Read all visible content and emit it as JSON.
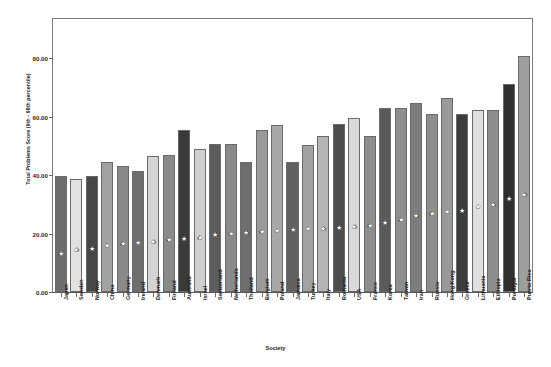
{
  "chart_data": {
    "type": "bar",
    "title": "",
    "xlabel": "Society",
    "ylabel": "Total Problems Score (9th - 98th percentile)",
    "ylim": [
      0,
      80
    ],
    "yticks": [
      "0.00",
      "20.00",
      "40.00",
      "60.00",
      "80.00"
    ],
    "ytick_values": [
      0,
      20,
      40,
      60,
      80
    ],
    "grid": false,
    "legend": "none",
    "categories": [
      "Japan",
      "Sweden",
      "Norway",
      "China",
      "Germany",
      "Ireland",
      "Denmark",
      "Finland",
      "Australia",
      "Israel",
      "Switzerland",
      "Netherlands",
      "Thailand",
      "Belgium",
      "Poland",
      "Jamaica",
      "Turkey",
      "Italy",
      "Romania",
      "USA",
      "France",
      "Korea",
      "Taiwan",
      "Iran",
      "Russia",
      "Hong Kong",
      "Greece",
      "Lithuania",
      "Ethiopia",
      "Portugal",
      "Puerto Rico"
    ],
    "series": [
      {
        "name": "Total Problems Score (98th percentile)",
        "values": [
          39.5,
          38.8,
          39.6,
          44.5,
          43.0,
          41.5,
          46.5,
          46.8,
          55.5,
          48.8,
          50.5,
          50.5,
          44.5,
          55.5,
          57.0,
          44.5,
          50.3,
          53.2,
          57.5,
          59.5,
          53.3,
          63.0,
          62.8,
          64.5,
          61.0,
          66.3,
          61.0,
          62.3,
          62.3,
          71.0,
          80.8
        ]
      },
      {
        "name": "Total Problems Score (9th percentile, star marker)",
        "values": [
          13.3,
          14.6,
          14.9,
          16.0,
          16.6,
          17.2,
          17.6,
          18.0,
          18.6,
          18.9,
          19.8,
          20.2,
          20.6,
          21.0,
          21.2,
          21.5,
          21.8,
          22.0,
          22.3,
          22.6,
          22.9,
          24.0,
          24.8,
          26.4,
          27.0,
          27.8,
          28.2,
          29.5,
          30.0,
          32.0,
          33.4
        ]
      }
    ],
    "bar_colors": [
      "#6e6e6e",
      "#e2e2e2",
      "#474747",
      "#a2a2a2",
      "#8a8a8a",
      "#6e6e6e",
      "#d4d4d4",
      "#8a8a8a",
      "#3a3a3a",
      "#cfcfcf",
      "#5c5c5c",
      "#8a8a8a",
      "#6e6e6e",
      "#9a9a9a",
      "#a8a8a8",
      "#616161",
      "#a2a2a2",
      "#b4b4b4",
      "#4d4d4d",
      "#d9d9d9",
      "#8e8e8e",
      "#5a5a5a",
      "#8e8e8e",
      "#7d7d7d",
      "#8e8e8e",
      "#9a9a9a",
      "#3c3c3c",
      "#e0e0e0",
      "#8e8e8e",
      "#2f2f2f",
      "#9e9e9e"
    ],
    "marker_symbol": "star"
  }
}
